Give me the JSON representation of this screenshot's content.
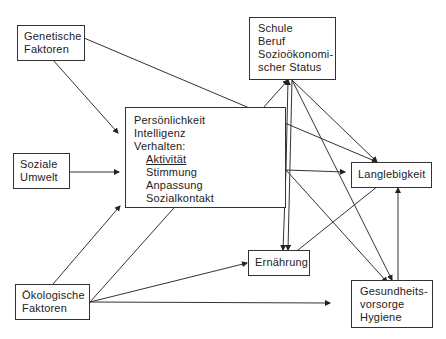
{
  "diagram": {
    "type": "flow-diagram",
    "nodes": {
      "genetic": {
        "lines": [
          "Genetische",
          "Faktoren"
        ]
      },
      "social": {
        "lines": [
          "Soziale",
          "Umwelt"
        ]
      },
      "ecological": {
        "lines": [
          "Ökologische",
          "Faktoren"
        ]
      },
      "personality": {
        "lines": [
          "Persönlichkeit",
          "Intelligenz",
          "Verhalten:"
        ],
        "sublines": [
          "Aktivität",
          "Stimmung",
          "Anpassung",
          "Sozialkontakt"
        ]
      },
      "school": {
        "lines": [
          "Schule",
          "Beruf",
          "Sozioökonomi-",
          "scher Status"
        ]
      },
      "longevity": {
        "lines": [
          "Langlebigkeit"
        ]
      },
      "nutrition": {
        "lines": [
          "Ernährung"
        ]
      },
      "health": {
        "lines": [
          "Gesundheits-",
          "vorsorge",
          "Hygiene"
        ]
      }
    },
    "edges": [
      {
        "from": "genetic",
        "to": "personality"
      },
      {
        "from": "genetic",
        "to": "longevity"
      },
      {
        "from": "social",
        "to": "personality"
      },
      {
        "from": "ecological",
        "to": "personality"
      },
      {
        "from": "ecological",
        "to": "school"
      },
      {
        "from": "ecological",
        "to": "nutrition"
      },
      {
        "from": "ecological",
        "to": "health"
      },
      {
        "from": "personality",
        "to": "school"
      },
      {
        "from": "personality",
        "to": "longevity"
      },
      {
        "from": "personality",
        "to": "nutrition"
      },
      {
        "from": "personality",
        "to": "health"
      },
      {
        "from": "school",
        "to": "longevity"
      },
      {
        "from": "school",
        "to": "nutrition"
      },
      {
        "from": "school",
        "to": "health"
      },
      {
        "from": "nutrition",
        "to": "longevity"
      },
      {
        "from": "health",
        "to": "longevity"
      }
    ]
  }
}
